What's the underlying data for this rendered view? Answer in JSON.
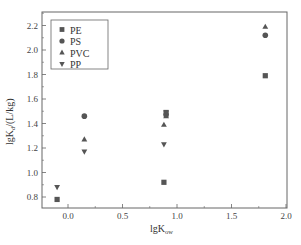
{
  "chart_data": {
    "type": "scatter",
    "title": "",
    "xlabel": "lgKow",
    "ylabel": "lgKd/(L/kg)",
    "xlim": [
      -0.24,
      2.0
    ],
    "ylim": [
      0.72,
      2.32
    ],
    "xticks": [
      0.0,
      0.5,
      1.0,
      1.5,
      2.0
    ],
    "xtick_labels": [
      "0.0",
      "0.5",
      "1.0",
      "1.5",
      "2.0"
    ],
    "yticks": [
      0.8,
      1.0,
      1.2,
      1.4,
      1.6,
      1.8,
      2.0,
      2.2
    ],
    "ytick_labels": [
      "0.8",
      "1.0",
      "1.2",
      "1.4",
      "1.6",
      "1.8",
      "2.0",
      "2.2"
    ],
    "grid": false,
    "legend_position": "upper left",
    "series": [
      {
        "name": "PE",
        "marker": "square",
        "points": [
          [
            -0.1,
            0.78
          ],
          [
            0.88,
            0.92
          ],
          [
            0.9,
            1.49
          ],
          [
            1.81,
            1.79
          ]
        ]
      },
      {
        "name": "PS",
        "marker": "circle",
        "points": [
          [
            0.15,
            1.46
          ],
          [
            0.9,
            1.47
          ],
          [
            1.81,
            2.12
          ]
        ]
      },
      {
        "name": "PVC",
        "marker": "triangle-up",
        "points": [
          [
            0.15,
            1.27
          ],
          [
            0.88,
            1.39
          ],
          [
            0.9,
            1.46
          ],
          [
            1.81,
            2.19
          ]
        ]
      },
      {
        "name": "PP",
        "marker": "triangle-down",
        "points": [
          [
            -0.1,
            0.88
          ],
          [
            0.15,
            1.17
          ],
          [
            0.88,
            1.23
          ],
          [
            0.9,
            1.49
          ]
        ]
      }
    ]
  },
  "axes": {
    "xlabel_main": "lgK",
    "xlabel_sub": "ow",
    "ylabel_main": "lgK",
    "ylabel_sub": "d",
    "ylabel_unit": "/(L/kg)"
  },
  "legend": [
    {
      "label": "PE",
      "marker": "square"
    },
    {
      "label": "PS",
      "marker": "circle"
    },
    {
      "label": "PVC",
      "marker": "triangle-up"
    },
    {
      "label": "PP",
      "marker": "triangle-down"
    }
  ],
  "colors": {
    "marker": "#555555",
    "axis": "#555555"
  }
}
